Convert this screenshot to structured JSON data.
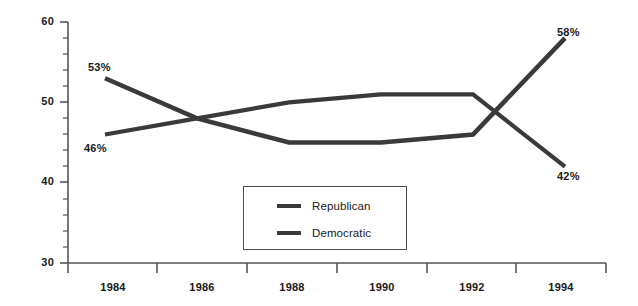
{
  "chart_data": {
    "type": "line",
    "title": "",
    "subtitle": "",
    "xlabel": "",
    "ylabel": "",
    "x": [
      1984,
      1986,
      1988,
      1990,
      1992,
      1994
    ],
    "categories": [
      "1984",
      "1986",
      "1988",
      "1990",
      "1992",
      "1994"
    ],
    "xlim": [
      1983,
      1995
    ],
    "ylim": [
      30,
      60
    ],
    "y_ticks_major": [
      30,
      40,
      50,
      60
    ],
    "y_tick_labels": [
      "30",
      "40",
      "50",
      "60"
    ],
    "y_minor_tick_step": 2,
    "grid": false,
    "legend_position": "bottom-center",
    "series": [
      {
        "name": "Republican",
        "color": "#3a3a3a",
        "values": [
          53,
          48,
          45,
          45,
          46,
          58
        ],
        "annotations": [
          {
            "x": 1984,
            "value": 53,
            "label": "53%"
          },
          {
            "x": 1994,
            "value": 58,
            "label": "58%"
          }
        ]
      },
      {
        "name": "Democratic",
        "color": "#3a3a3a",
        "values": [
          46,
          48,
          50,
          51,
          51,
          42
        ],
        "annotations": [
          {
            "x": 1984,
            "value": 46,
            "label": "46%"
          },
          {
            "x": 1994,
            "value": 42,
            "label": "42%"
          }
        ]
      }
    ]
  },
  "axes": {
    "y_labels": [
      "60",
      "50",
      "40",
      "30"
    ],
    "x_labels": [
      "1984",
      "1986",
      "1988",
      "1990",
      "1992",
      "1994"
    ]
  },
  "annotations": {
    "rep_start": "53%",
    "rep_end": "58%",
    "dem_start": "46%",
    "dem_end": "42%"
  },
  "legend": {
    "items": [
      {
        "label": "Republican"
      },
      {
        "label": "Democratic"
      }
    ]
  },
  "colors": {
    "line": "#3a3a3a",
    "axis": "#555555",
    "text": "#1a1a1a",
    "background": "#ffffff"
  }
}
